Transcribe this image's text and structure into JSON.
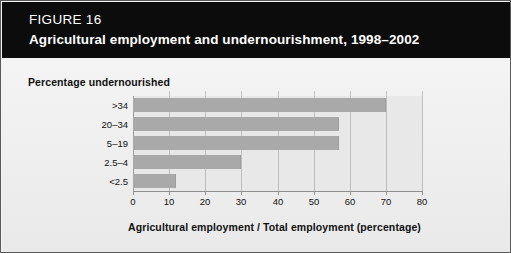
{
  "figure": {
    "number_label": "FIGURE 16",
    "title": "Agricultural employment and undernourishment, 1998–2002"
  },
  "colors": {
    "header_background": "#0c0c0c",
    "header_text": "#ffffff",
    "page_background": "#f3f3f3",
    "plot_background": "#e8e8e8",
    "bar_fill": "#a9a9a9",
    "gridline": "#bdbdbd",
    "axis_line": "#8e8e8e",
    "text": "#111111"
  },
  "chart_data": {
    "type": "bar",
    "orientation": "horizontal",
    "title": "Agricultural employment and undernourishment, 1998–2002",
    "subtitle": "",
    "categories": [
      ">34",
      "20–34",
      "5–19",
      "2.5–4",
      "<2.5"
    ],
    "values": [
      70,
      57,
      57,
      30,
      12
    ],
    "series": [
      {
        "name": "Agricultural employment / Total employment (percentage)",
        "values": [
          70,
          57,
          57,
          30,
          12
        ]
      }
    ],
    "xlabel": "Agricultural employment / Total employment (percentage)",
    "ylabel": "Percentage undernourished",
    "xlim": [
      0,
      80
    ],
    "xticks": [
      0,
      10,
      20,
      30,
      40,
      50,
      60,
      70,
      80
    ],
    "xtick_labels": [
      "0",
      "10",
      "20",
      "30",
      "40",
      "50",
      "60",
      "70",
      "80"
    ],
    "grid": true,
    "grid_axis": "x",
    "legend": false,
    "legend_position": "none"
  }
}
